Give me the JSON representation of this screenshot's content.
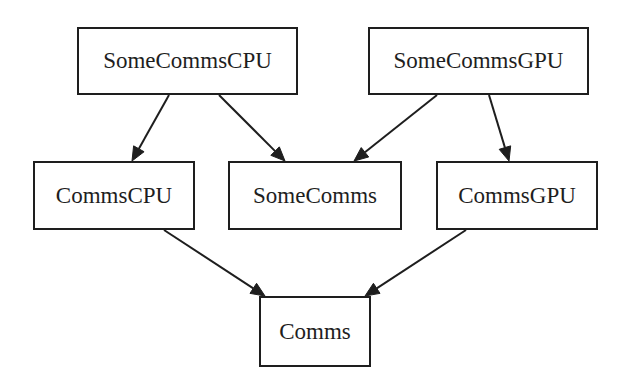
{
  "diagram": {
    "type": "directed-graph",
    "colors": {
      "background": "#ffffff",
      "stroke": "#1e1e1e",
      "text": "#1e1e1e"
    },
    "nodes": [
      {
        "id": "SomeCommsCPU",
        "label": "SomeCommsCPU",
        "x": 77,
        "y": 27,
        "w": 221,
        "h": 68
      },
      {
        "id": "SomeCommsGPU",
        "label": "SomeCommsGPU",
        "x": 368,
        "y": 27,
        "w": 221,
        "h": 68
      },
      {
        "id": "CommsCPU",
        "label": "CommsCPU",
        "x": 33,
        "y": 161,
        "w": 162,
        "h": 69
      },
      {
        "id": "SomeComms",
        "label": "SomeComms",
        "x": 228,
        "y": 161,
        "w": 174,
        "h": 69
      },
      {
        "id": "CommsGPU",
        "label": "CommsGPU",
        "x": 436,
        "y": 161,
        "w": 162,
        "h": 69
      },
      {
        "id": "Comms",
        "label": "Comms",
        "x": 259,
        "y": 296,
        "w": 112,
        "h": 71
      }
    ],
    "edges": [
      {
        "from": "SomeCommsCPU",
        "to": "CommsCPU",
        "x1": 169,
        "y1": 95,
        "x2": 132,
        "y2": 161
      },
      {
        "from": "SomeCommsCPU",
        "to": "SomeComms",
        "x1": 219,
        "y1": 95,
        "x2": 285,
        "y2": 161
      },
      {
        "from": "SomeCommsGPU",
        "to": "SomeComms",
        "x1": 437,
        "y1": 95,
        "x2": 354,
        "y2": 161
      },
      {
        "from": "SomeCommsGPU",
        "to": "CommsGPU",
        "x1": 489,
        "y1": 95,
        "x2": 509,
        "y2": 161
      },
      {
        "from": "CommsCPU",
        "to": "Comms",
        "x1": 164,
        "y1": 230,
        "x2": 265,
        "y2": 296
      },
      {
        "from": "CommsGPU",
        "to": "Comms",
        "x1": 466,
        "y1": 230,
        "x2": 365,
        "y2": 296
      }
    ]
  }
}
